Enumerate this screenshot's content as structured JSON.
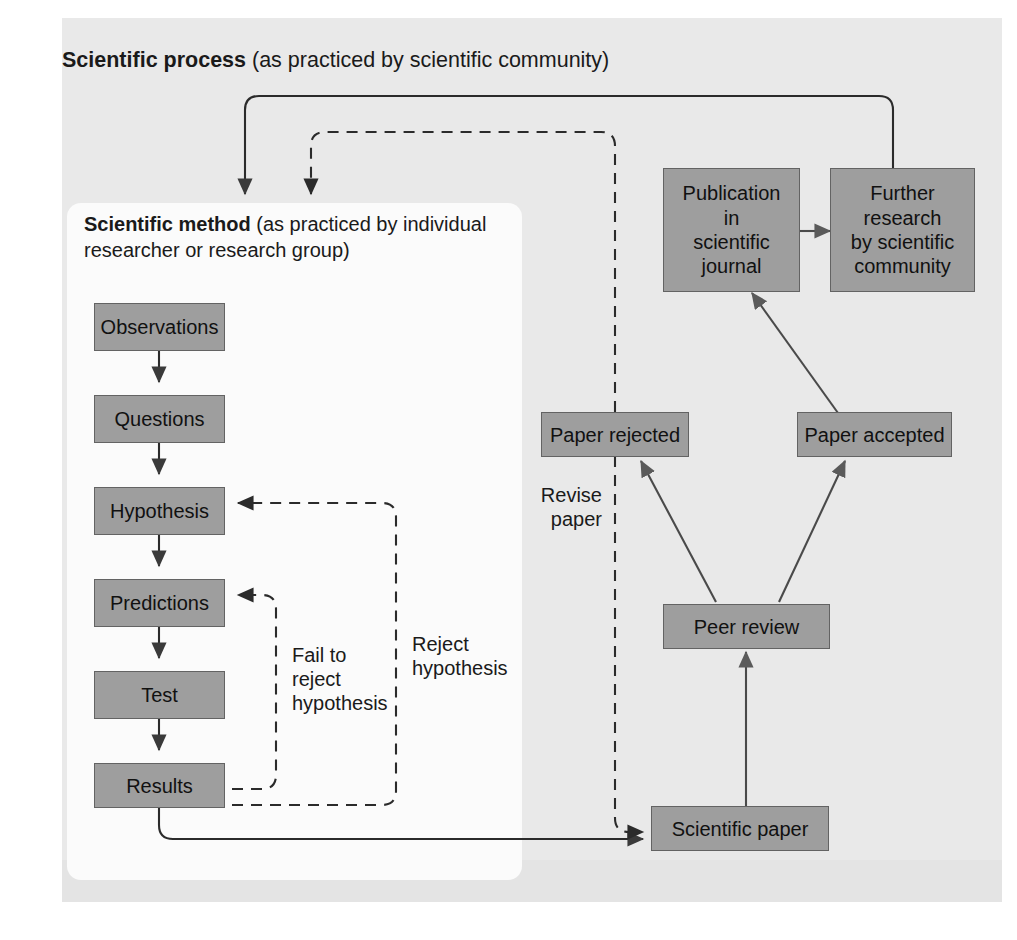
{
  "diagram": {
    "title_bold": "Scientific process",
    "title_rest": " (as practiced by scientific community)",
    "subtitle_bold": "Scientific method",
    "subtitle_rest": " (as practiced by individual researcher or research group)"
  },
  "nodes": {
    "observations": "Observations",
    "questions": "Questions",
    "hypothesis": "Hypothesis",
    "predictions": "Predictions",
    "test": "Test",
    "results": "Results",
    "scientific_paper": "Scientific paper",
    "peer_review": "Peer review",
    "paper_rejected": "Paper rejected",
    "paper_accepted": "Paper accepted",
    "publication": "Publication\nin\nscientific\njournal",
    "further_research": "Further\nresearch\nby scientific\ncommunity"
  },
  "labels": {
    "fail_to_reject": "Fail to\nreject\nhypothesis",
    "reject_hypothesis": "Reject\nhypothesis",
    "revise_paper": "Revise\npaper"
  },
  "colors": {
    "node_fill": "#9e9e9e",
    "node_border": "#636363",
    "panel_bg": "#e9e9e9",
    "inner_bg": "#fbfbfb",
    "wire": "#4a4a4a",
    "dashed_wire": "#2b2b2b"
  }
}
